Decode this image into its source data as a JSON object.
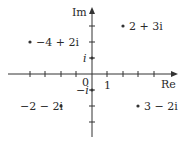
{
  "diagram": {
    "axes": {
      "x_label": "Re",
      "y_label": "Im",
      "origin_label": "0",
      "x_unit_label": "1",
      "y_unit_label": "i",
      "y_neg_unit_label": "−i"
    },
    "points": [
      {
        "label": "2 + 3i",
        "re": 2,
        "im": 3
      },
      {
        "label": "−4 + 2i",
        "re": -4,
        "im": 2
      },
      {
        "label": "−2 − 2i",
        "re": -2,
        "im": -2
      },
      {
        "label": "3 − 2i",
        "re": 3,
        "im": -2
      }
    ],
    "x_ticks": [
      -4,
      -3,
      -2,
      -1,
      1,
      2,
      3,
      4
    ],
    "y_ticks": [
      3,
      2,
      1,
      -1,
      -2,
      -3
    ]
  }
}
